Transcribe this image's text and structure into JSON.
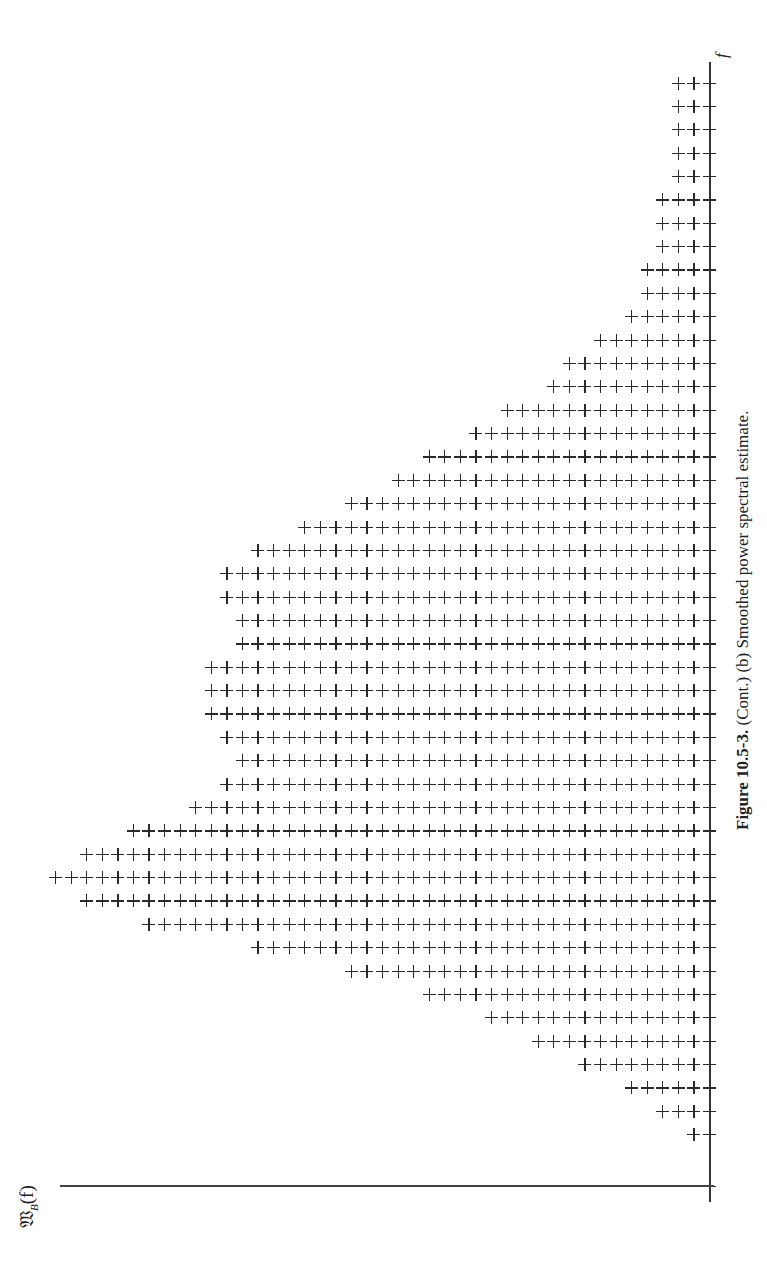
{
  "chart_data": {
    "type": "bar",
    "orientation": "rotated-90 (f axis vertical on right, value axis horizontal at bottom)",
    "title": "Figure 10.5-3. (Cont.) (b) Smoothed power spectral estimate.",
    "xlabel": "f",
    "ylabel": "W_B(f)",
    "mark": "+",
    "categories": [
      1,
      2,
      3,
      4,
      5,
      6,
      7,
      8,
      9,
      10,
      11,
      12,
      13,
      14,
      15,
      16,
      17,
      18,
      19,
      20,
      21,
      22,
      23,
      24,
      25,
      26,
      27,
      28,
      29,
      30,
      31,
      32,
      33,
      34,
      35,
      36,
      37,
      38,
      39,
      40,
      41,
      42,
      43,
      44,
      45,
      46
    ],
    "values": [
      2,
      4,
      6,
      9,
      12,
      15,
      19,
      24,
      30,
      37,
      41,
      43,
      41,
      38,
      34,
      32,
      31,
      32,
      33,
      33,
      33,
      31,
      31,
      32,
      32,
      30,
      27,
      24,
      21,
      19,
      16,
      14,
      11,
      10,
      8,
      6,
      5,
      5,
      4,
      4,
      4,
      3,
      3,
      3,
      3,
      3
    ],
    "value_unit": "number of plus marks per frequency bin",
    "ylim": [
      0,
      43
    ],
    "grid": false,
    "legend": null
  },
  "figure": {
    "caption_label": "Figure 10.5-3.",
    "caption_text": " (Cont.) (b) Smoothed power spectral estimate.",
    "f_axis_label": "f",
    "w_axis_label_main": "𝔚",
    "w_axis_label_sub": "B",
    "w_axis_label_arg": "(f)"
  },
  "layout": {
    "axis_x": 709.5,
    "baseline_y": 1185,
    "row_y_top": 83,
    "row_step": 23.37,
    "plus_step": 15.57,
    "ink_color": "#2a2a2a"
  }
}
